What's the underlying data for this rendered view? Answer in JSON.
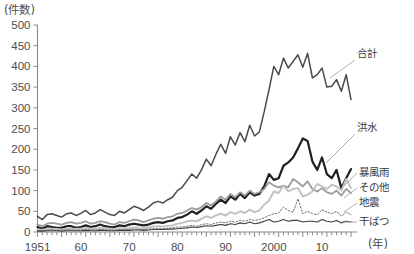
{
  "chart_data": {
    "type": "line",
    "title": "",
    "ylabel": "(件数)",
    "xlabel": "(年)",
    "ylim": [
      0,
      500
    ],
    "xlim": [
      1951,
      2016
    ],
    "grid": false,
    "legend_position": "right-inline",
    "y_ticks": [
      "0",
      "50",
      "100",
      "150",
      "200",
      "250",
      "300",
      "350",
      "400",
      "450",
      "500"
    ],
    "y_tick_values": [
      0,
      50,
      100,
      150,
      200,
      250,
      300,
      350,
      400,
      450,
      500
    ],
    "x_ticks": [
      "1951",
      "60",
      "70",
      "80",
      "90",
      "2000",
      "10"
    ],
    "x_tick_values": [
      1951,
      1960,
      1970,
      1980,
      1990,
      2000,
      2010
    ],
    "x": [
      1951,
      1952,
      1953,
      1954,
      1955,
      1956,
      1957,
      1958,
      1959,
      1960,
      1961,
      1962,
      1963,
      1964,
      1965,
      1966,
      1967,
      1968,
      1969,
      1970,
      1971,
      1972,
      1973,
      1974,
      1975,
      1976,
      1977,
      1978,
      1979,
      1980,
      1981,
      1982,
      1983,
      1984,
      1985,
      1986,
      1987,
      1988,
      1989,
      1990,
      1991,
      1992,
      1993,
      1994,
      1995,
      1996,
      1997,
      1998,
      1999,
      2000,
      2001,
      2002,
      2003,
      2004,
      2005,
      2006,
      2007,
      2008,
      2009,
      2010,
      2011,
      2012,
      2013,
      2014,
      2015,
      2016
    ],
    "series": [
      {
        "name": "合計",
        "label": "合計",
        "color": "#4a4a4a",
        "style": "solid",
        "width": 1.5,
        "values": [
          38,
          30,
          42,
          44,
          40,
          36,
          44,
          46,
          40,
          45,
          52,
          42,
          46,
          54,
          48,
          42,
          40,
          50,
          46,
          54,
          62,
          58,
          52,
          60,
          70,
          74,
          70,
          78,
          84,
          100,
          108,
          124,
          140,
          130,
          150,
          176,
          160,
          188,
          212,
          190,
          230,
          210,
          240,
          218,
          258,
          232,
          242,
          290,
          344,
          400,
          380,
          420,
          396,
          412,
          428,
          398,
          432,
          372,
          380,
          396,
          350,
          352,
          368,
          340,
          380,
          320
        ]
      },
      {
        "name": "洪水",
        "label": "洪水",
        "color": "#202020",
        "style": "solid",
        "width": 2.2,
        "values": [
          12,
          8,
          14,
          12,
          10,
          10,
          14,
          14,
          10,
          12,
          16,
          12,
          14,
          18,
          14,
          12,
          12,
          16,
          14,
          18,
          20,
          18,
          16,
          18,
          22,
          24,
          22,
          26,
          28,
          34,
          36,
          42,
          50,
          44,
          52,
          62,
          56,
          68,
          78,
          70,
          86,
          78,
          92,
          82,
          96,
          88,
          92,
          110,
          140,
          126,
          130,
          160,
          168,
          180,
          202,
          226,
          220,
          170,
          150,
          180,
          140,
          130,
          150,
          106,
          130,
          152
        ]
      },
      {
        "name": "暴風雨",
        "label": "暴風雨",
        "color": "#9b9b9b",
        "style": "solid",
        "width": 1.8,
        "values": [
          18,
          14,
          20,
          22,
          20,
          18,
          22,
          24,
          20,
          22,
          26,
          20,
          22,
          26,
          24,
          20,
          18,
          24,
          22,
          26,
          30,
          28,
          24,
          28,
          32,
          34,
          32,
          36,
          38,
          44,
          46,
          52,
          58,
          54,
          60,
          70,
          64,
          74,
          86,
          78,
          92,
          84,
          96,
          88,
          100,
          92,
          96,
          104,
          120,
          112,
          108,
          112,
          108,
          128,
          120,
          110,
          122,
          104,
          98,
          106,
          96,
          92,
          100,
          88,
          104,
          94
        ]
      },
      {
        "name": "その他",
        "label": "その他",
        "color": "#c3c3c3",
        "style": "solid",
        "width": 2.0,
        "values": [
          6,
          5,
          7,
          8,
          7,
          6,
          7,
          8,
          7,
          8,
          9,
          8,
          8,
          10,
          9,
          8,
          7,
          9,
          8,
          10,
          11,
          10,
          9,
          11,
          13,
          14,
          13,
          15,
          16,
          20,
          22,
          26,
          28,
          26,
          32,
          38,
          34,
          40,
          44,
          40,
          48,
          44,
          50,
          46,
          54,
          48,
          52,
          66,
          76,
          98,
          94,
          112,
          98,
          104,
          106,
          86,
          90,
          98,
          116,
          110,
          104,
          114,
          110,
          100,
          128,
          106
        ]
      },
      {
        "name": "地震",
        "label": "地震",
        "color": "#6f6f6f",
        "style": "dotted",
        "width": 1.0,
        "values": [
          4,
          3,
          4,
          5,
          4,
          4,
          5,
          5,
          4,
          5,
          6,
          5,
          5,
          6,
          5,
          5,
          4,
          6,
          5,
          6,
          7,
          6,
          6,
          7,
          8,
          8,
          8,
          9,
          10,
          12,
          12,
          14,
          16,
          14,
          18,
          20,
          18,
          22,
          24,
          22,
          26,
          24,
          28,
          26,
          30,
          28,
          30,
          34,
          40,
          44,
          46,
          60,
          52,
          48,
          80,
          44,
          50,
          44,
          42,
          54,
          48,
          44,
          50,
          38,
          48,
          42
        ]
      },
      {
        "name": "干ばつ",
        "label": "干ばつ",
        "color": "#3c3c3c",
        "style": "solid",
        "width": 1.1,
        "values": [
          2,
          2,
          3,
          3,
          3,
          2,
          3,
          3,
          3,
          3,
          4,
          3,
          3,
          4,
          4,
          3,
          3,
          4,
          4,
          4,
          5,
          5,
          4,
          5,
          6,
          6,
          6,
          7,
          7,
          8,
          9,
          10,
          12,
          11,
          13,
          15,
          14,
          16,
          18,
          16,
          20,
          18,
          22,
          20,
          24,
          20,
          22,
          26,
          30,
          24,
          26,
          30,
          26,
          28,
          28,
          24,
          26,
          26,
          24,
          30,
          26,
          24,
          28,
          22,
          26,
          24
        ]
      }
    ],
    "legend_labels": [
      "合計",
      "洪水",
      "暴風雨",
      "その他",
      "地震",
      "干ばつ"
    ]
  }
}
